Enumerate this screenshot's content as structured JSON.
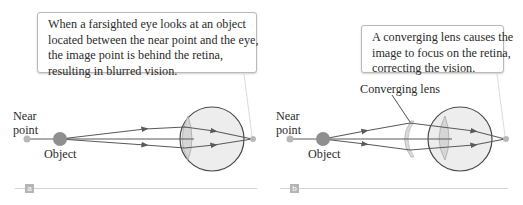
{
  "panels": [
    {
      "id": "a",
      "tag": "a",
      "callout": {
        "lines": [
          "When a farsighted eye looks at an object",
          "located between the near point and the eye,",
          "the image point is behind the retina,",
          "resulting in blurred vision."
        ]
      },
      "labels": {
        "near_point": [
          "Near",
          "point"
        ],
        "object": "Object"
      }
    },
    {
      "id": "b",
      "tag": "b",
      "callout": {
        "lines": [
          "A converging lens causes the",
          "image to focus on the retina,",
          "correcting the vision."
        ]
      },
      "labels": {
        "near_point": [
          "Near",
          "point"
        ],
        "object": "Object",
        "lens": "Converging lens"
      }
    }
  ],
  "colors": {
    "ray": "#5a5a5a",
    "object_fill": "#8f8f8f",
    "near_point_fill": "#b8b8b8",
    "eye_fill": "#ededed",
    "eye_stroke": "#4a4a4a",
    "lens_fill": "#d9d9d9",
    "rule": "#d4d4d4",
    "tag_fill": "#b5b5b5"
  }
}
